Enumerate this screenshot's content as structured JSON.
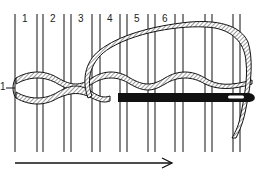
{
  "figure": {
    "warp_labels": [
      "1",
      "2",
      "3",
      "4",
      "5",
      "6"
    ],
    "row_label": "1",
    "direction": "left-to-right",
    "colors": {
      "ink": "#111111",
      "hatch_fill": "#b8b8b8",
      "background": "#ffffff"
    },
    "elements": [
      "warp-threads",
      "twined-weft-rope",
      "needle",
      "looping-weft-strand",
      "direction-arrow"
    ]
  }
}
